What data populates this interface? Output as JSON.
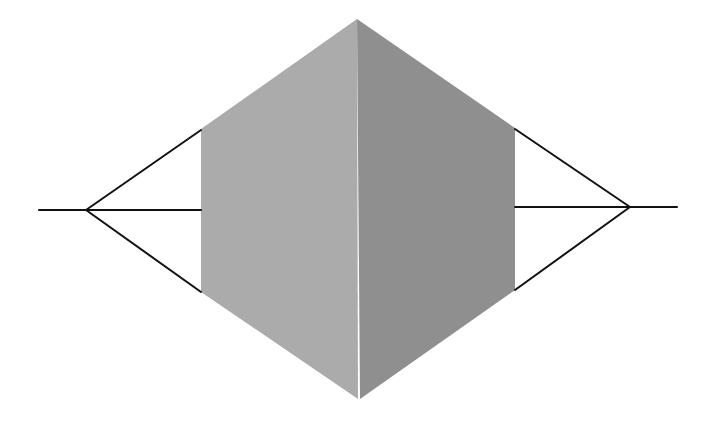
{
  "diagram": {
    "colors": {
      "background": "#ffffff",
      "left_face": "#ababab",
      "right_face": "#8f8f8f",
      "lines": "#111111"
    },
    "prism": {
      "top": [
        357,
        19
      ],
      "bottom": [
        360,
        399
      ],
      "center_edge_x": 358,
      "left_face": [
        [
          201,
          129
        ],
        [
          357,
          19
        ],
        [
          358,
          399
        ],
        [
          201,
          292
        ]
      ],
      "right_face": [
        [
          357,
          19
        ],
        [
          515,
          128
        ],
        [
          515,
          290
        ],
        [
          360,
          399
        ]
      ]
    },
    "left_projection": {
      "tail": [
        [
          39,
          210
        ],
        [
          86,
          210
        ]
      ],
      "vanishing_point": [
        86,
        210
      ],
      "rays": [
        [
          [
            86,
            210
          ],
          [
            201,
            130
          ]
        ],
        [
          [
            86,
            210
          ],
          [
            201,
            210
          ]
        ],
        [
          [
            86,
            210
          ],
          [
            201,
            292
          ]
        ]
      ]
    },
    "right_projection": {
      "tail": [
        [
          630,
          207
        ],
        [
          677,
          207
        ]
      ],
      "vanishing_point": [
        630,
        207
      ],
      "rays": [
        [
          [
            515,
            129
          ],
          [
            630,
            207
          ]
        ],
        [
          [
            515,
            207
          ],
          [
            630,
            207
          ]
        ],
        [
          [
            515,
            290
          ],
          [
            630,
            207
          ]
        ]
      ]
    },
    "line_width": 2
  }
}
